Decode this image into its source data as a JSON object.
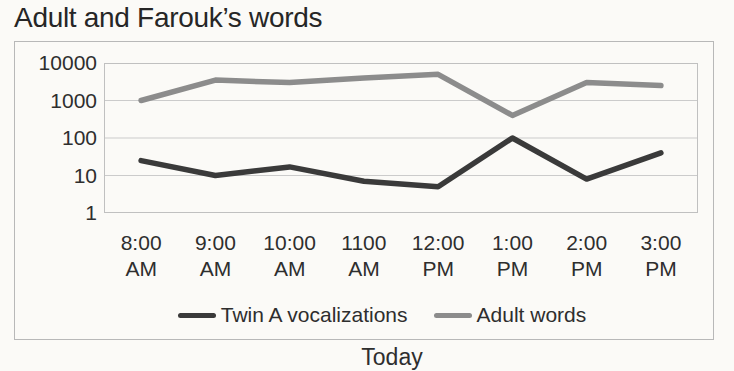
{
  "title": "Adult and Farouk’s words",
  "colors": {
    "twin_a_line": "#3a3a3a",
    "adult_line": "#8c8c8c",
    "gridline": "#cbcbcb",
    "plot_border": "#c0c0c0",
    "outer_border": "#b8b8b8",
    "text": "#2e2e2e"
  },
  "chart_data": {
    "type": "line",
    "title": "Adult and Farouk’s words",
    "xlabel": "Today",
    "ylabel": "",
    "yscale": "log",
    "ylim": [
      1,
      10000
    ],
    "y_ticks": [
      10000,
      1000,
      100,
      10,
      1
    ],
    "grid": true,
    "legend_position": "bottom-center",
    "categories": [
      "8:00 AM",
      "9:00 AM",
      "10:00 AM",
      "1100 AM",
      "12:00 PM",
      "1:00 PM",
      "2:00 PM",
      "3:00 PM"
    ],
    "x_tick_labels": [
      {
        "line1": "8:00",
        "line2": "AM"
      },
      {
        "line1": "9:00",
        "line2": "AM"
      },
      {
        "line1": "10:00",
        "line2": "AM"
      },
      {
        "line1": "1100",
        "line2": "AM"
      },
      {
        "line1": "12:00",
        "line2": "PM"
      },
      {
        "line1": "1:00",
        "line2": "PM"
      },
      {
        "line1": "2:00",
        "line2": "PM"
      },
      {
        "line1": "3:00",
        "line2": "PM"
      }
    ],
    "series": [
      {
        "name": "Twin A vocalizations",
        "color": "#3a3a3a",
        "values": [
          25,
          10,
          17,
          7,
          5,
          100,
          8,
          40
        ]
      },
      {
        "name": "Adult words",
        "color": "#8c8c8c",
        "values": [
          1000,
          3500,
          3000,
          4000,
          5000,
          400,
          3000,
          2500
        ]
      }
    ]
  }
}
